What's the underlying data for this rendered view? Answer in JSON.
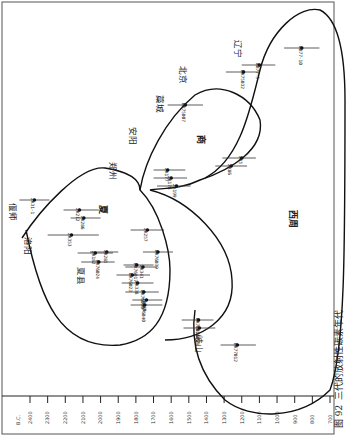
{
  "caption": {
    "figure_no": "图 92",
    "title": "三代的放射性碳素年代"
  },
  "axis": {
    "unit": "B.C.",
    "ticks": [
      "2400",
      "2300",
      "2200",
      "2100",
      "2000",
      "1900",
      "1800",
      "1700",
      "1600",
      "1500",
      "1400",
      "1300",
      "1200",
      "1100",
      "1000",
      "900",
      "800",
      "700"
    ]
  },
  "periods": {
    "xia": "夏",
    "shang": "商",
    "zhou": "西周"
  },
  "places": {
    "yanshi": "偃师",
    "luoyang": "洛阳",
    "xiaxian": "夏县",
    "zhengzhou": "郑州",
    "anyang": "安阳",
    "gaocheng": "藁城",
    "beijing": "北京",
    "liaoning": "辽宁",
    "qishan": "岐山"
  },
  "samples": [
    {
      "id": "ZK31-1"
    },
    {
      "id": "ZK212"
    },
    {
      "id": "ZK286"
    },
    {
      "id": "ZK285"
    },
    {
      "id": "ZK353"
    },
    {
      "id": "ZK182"
    },
    {
      "id": "BK76024"
    },
    {
      "id": "ZK257"
    },
    {
      "id": "BK76039"
    },
    {
      "id": "BK76017"
    },
    {
      "id": "ZK341"
    },
    {
      "id": "BK76023"
    },
    {
      "id": "ZK338"
    },
    {
      "id": "BK76030"
    },
    {
      "id": "ZK340"
    },
    {
      "id": "BK76040"
    },
    {
      "id": "ZK177"
    },
    {
      "id": "ZK178"
    },
    {
      "id": "ZK199"
    },
    {
      "id": "BK75007"
    },
    {
      "id": "ZK5"
    },
    {
      "id": "ZK86"
    },
    {
      "id": "BK75032"
    },
    {
      "id": "WB77-5"
    },
    {
      "id": "WB77-10"
    },
    {
      "id": "BK77011"
    },
    {
      "id": "BK76018"
    },
    {
      "id": "BK77012"
    }
  ],
  "chart_data": {
    "type": "scatter",
    "xlabel": "B.C.",
    "ylabel": "",
    "xlim": [
      2400,
      700
    ],
    "x_direction": "descending (years B.C.)",
    "grid": false,
    "representation": "radiocarbon dates (point = central date, line = error range), grouped by dynasty region outlines",
    "groups": [
      {
        "name": "夏",
        "sites": [
          "偃师",
          "洛阳",
          "夏县"
        ],
        "samples": [
          {
            "id": "ZK31-1",
            "site": "偃师",
            "date": 2375,
            "range": [
              2460,
              2290
            ]
          },
          {
            "id": "ZK212",
            "site": "偃师",
            "date": 2120,
            "range": [
              2210,
              2010
            ]
          },
          {
            "id": "ZK286",
            "site": "偃师",
            "date": 2095,
            "range": [
              2170,
              2000
            ]
          },
          {
            "id": "ZK285",
            "site": "偃师",
            "date": 1965,
            "range": [
              2060,
              1900
            ]
          },
          {
            "id": "ZK353",
            "site": "洛阳",
            "date": 2165,
            "range": [
              2300,
              2010
            ]
          },
          {
            "id": "ZK182",
            "site": "夏县",
            "date": 2030,
            "range": [
              2130,
              1930
            ]
          },
          {
            "id": "BK76024",
            "site": "夏县",
            "date": 2010,
            "range": [
              2110,
              1920
            ]
          }
        ]
      },
      {
        "name": "商",
        "sites": [
          "郑州",
          "安阳",
          "藁城"
        ],
        "samples": [
          {
            "id": "ZK257",
            "site": "偃师",
            "date": 1735,
            "range": [
              1830,
              1640
            ]
          },
          {
            "id": "BK76039",
            "site": "偃师",
            "date": 1675,
            "range": [
              1760,
              1590
            ]
          },
          {
            "id": "BK76017",
            "site": "偃师",
            "date": 1795,
            "range": [
              1870,
              1700
            ]
          },
          {
            "id": "ZK341",
            "site": "偃师",
            "date": 1760,
            "range": [
              1860,
              1680
            ]
          },
          {
            "id": "BK76023",
            "site": "偃师",
            "date": 1820,
            "range": [
              1910,
              1720
            ]
          },
          {
            "id": "ZK338",
            "site": "偃师",
            "date": 1790,
            "range": [
              1880,
              1700
            ]
          },
          {
            "id": "BK76030",
            "site": "偃师",
            "date": 1755,
            "range": [
              1860,
              1670
            ]
          },
          {
            "id": "ZK340",
            "site": "偃师",
            "date": 1740,
            "range": [
              1820,
              1650
            ]
          },
          {
            "id": "BK76040",
            "site": "偃师",
            "date": 1750,
            "range": [
              1830,
              1650
            ]
          },
          {
            "id": "ZK177",
            "site": "郑州",
            "date": 1620,
            "range": [
              1700,
              1520
            ]
          },
          {
            "id": "ZK178",
            "site": "郑州",
            "date": 1600,
            "range": [
              1700,
              1510
            ]
          },
          {
            "id": "ZK199",
            "site": "郑州",
            "date": 1570,
            "range": [
              1680,
              1490
            ]
          },
          {
            "id": "BK75007",
            "site": "藁城",
            "date": 1520,
            "range": [
              1620,
              1420
            ]
          },
          {
            "id": "ZK5",
            "site": "安阳",
            "date": 1200,
            "range": [
              1310,
              1120
            ]
          },
          {
            "id": "ZK86",
            "site": "安阳",
            "date": 1260,
            "range": [
              1350,
              1170
            ]
          }
        ]
      },
      {
        "name": "西周",
        "sites": [
          "北京",
          "辽宁",
          "岐山"
        ],
        "samples": [
          {
            "id": "BK75032",
            "site": "北京",
            "date": 1190,
            "range": [
              1290,
              1100
            ]
          },
          {
            "id": "WB77-5",
            "site": "辽宁",
            "date": 1100,
            "range": [
              1200,
              1010
            ]
          },
          {
            "id": "WB77-10",
            "site": "辽宁",
            "date": 860,
            "range": [
              960,
              760
            ]
          },
          {
            "id": "BK77011",
            "site": "岐山",
            "date": 1445,
            "range": [
              1540,
              1360
            ]
          },
          {
            "id": "BK76018",
            "site": "岐山",
            "date": 1440,
            "range": [
              1530,
              1350
            ]
          },
          {
            "id": "BK77012",
            "site": "岐山",
            "date": 1225,
            "range": [
              1320,
              1120
            ]
          }
        ]
      }
    ]
  }
}
